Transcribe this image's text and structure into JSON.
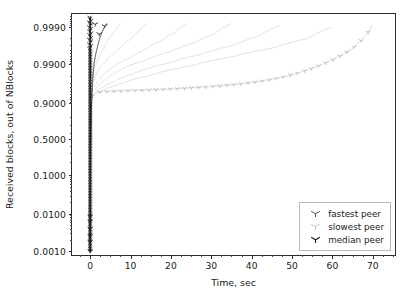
{
  "chart_data": {
    "type": "line",
    "title": "",
    "xlabel": "Time, sec",
    "ylabel": "Received blocks, out of NBlocks",
    "yscale": "logit",
    "xscale": "linear",
    "xlim": [
      -4.5,
      76.0
    ],
    "ylim": [
      0.0007,
      0.99955
    ],
    "grid": false,
    "xticks": [
      0,
      10,
      20,
      30,
      40,
      50,
      60,
      70
    ],
    "xtick_labels": [
      "0",
      "10",
      "20",
      "30",
      "40",
      "50",
      "60",
      "70"
    ],
    "yticks": [
      0.999,
      0.99,
      0.9,
      0.5,
      0.1,
      0.01,
      0.001
    ],
    "ytick_labels": [
      "0.9990",
      "0.9900",
      "0.9000",
      "0.5000",
      "0.1000",
      "0.0100",
      "0.0010"
    ],
    "legend_position": "lower right",
    "legend_entries": [
      "fastest peer",
      "slowest peer",
      "median peer"
    ],
    "colors": {
      "fastest_peer": "#3d3d3d",
      "slowest_peer": "#b9b9b9",
      "median_peer": "#1a1a1a",
      "other_peers": "#d6d6d6",
      "axis": "#2b2b2b",
      "background": "#ffffff"
    },
    "marker": "tri_down",
    "series": [
      {
        "name": "fastest peer",
        "color": "#3d3d3d",
        "x": [
          0.02,
          0.05,
          0.08,
          0.12,
          0.18,
          0.25,
          0.35,
          0.5,
          0.7,
          0.95,
          1.3,
          1.8,
          2.4,
          3.2,
          4.1
        ],
        "y": [
          0.001,
          0.01,
          0.1,
          0.3,
          0.5,
          0.7,
          0.9,
          0.95,
          0.98,
          0.99,
          0.994,
          0.9965,
          0.998,
          0.9988,
          0.9992
        ]
      },
      {
        "name": "slowest peer",
        "color": "#b9b9b9",
        "x": [
          0.4,
          1.2,
          2.0,
          3.0,
          4.0,
          5.5,
          7.0,
          9.0,
          11.0,
          13.0,
          15.0,
          17.0,
          19.0,
          21.0,
          23.0,
          25.0,
          27.0,
          29.0,
          31.0,
          33.0,
          35.0,
          37.0,
          39.0,
          41.0,
          43.0,
          45.0,
          47.0,
          49.0,
          51.0,
          53.0,
          55.0,
          57.0,
          59.0,
          61.0,
          63.0,
          65.0,
          67.0,
          68.5,
          70.0
        ],
        "y": [
          0.93,
          0.944,
          0.947,
          0.948,
          0.949,
          0.95,
          0.9505,
          0.9512,
          0.952,
          0.9528,
          0.9535,
          0.9545,
          0.9555,
          0.9565,
          0.9575,
          0.9588,
          0.96,
          0.9612,
          0.9625,
          0.964,
          0.9655,
          0.9672,
          0.969,
          0.971,
          0.973,
          0.9752,
          0.9775,
          0.98,
          0.9825,
          0.985,
          0.9872,
          0.9895,
          0.9915,
          0.9932,
          0.9948,
          0.9962,
          0.9976,
          0.9984,
          0.9991
        ]
      },
      {
        "name": "median peer",
        "color": "#1a1a1a",
        "x": [
          0.0,
          0.0,
          0.0,
          0.0,
          0.0,
          0.0,
          0.0,
          0.0,
          0.0,
          0.0,
          0.0,
          0.0
        ],
        "y": [
          0.001,
          0.0025,
          0.006,
          0.01,
          0.03,
          0.1,
          0.3,
          0.5,
          0.7,
          0.9,
          0.99,
          0.999
        ]
      },
      {
        "name": "other peer 1",
        "color": "#d6d6d6",
        "x": [
          0.6,
          1.5,
          2.5,
          3.5,
          4.5,
          5.5,
          6.5,
          7.5
        ],
        "y": [
          0.98,
          0.99,
          0.9945,
          0.9965,
          0.9978,
          0.9985,
          0.9989,
          0.9992
        ]
      },
      {
        "name": "other peer 2",
        "color": "#d6d6d6",
        "x": [
          0.8,
          2.0,
          4.0,
          6.0,
          8.0,
          10.0,
          12.0,
          14.0
        ],
        "y": [
          0.97,
          0.986,
          0.992,
          0.995,
          0.9968,
          0.9979,
          0.9987,
          0.9992
        ]
      },
      {
        "name": "other peer 3",
        "color": "#d6d6d6",
        "x": [
          1.0,
          3.0,
          6.0,
          10.0,
          14.0,
          18.0,
          21.0,
          24.0
        ],
        "y": [
          0.96,
          0.98,
          0.989,
          0.9935,
          0.9962,
          0.9978,
          0.9986,
          0.9992
        ]
      },
      {
        "name": "other peer 4",
        "color": "#d6d6d6",
        "x": [
          1.2,
          4.0,
          8.0,
          14.0,
          20.0,
          26.0,
          31.0,
          35.0
        ],
        "y": [
          0.955,
          0.976,
          0.987,
          0.9925,
          0.9955,
          0.9974,
          0.9985,
          0.9992
        ]
      },
      {
        "name": "other peer 5",
        "color": "#d6d6d6",
        "x": [
          1.5,
          6.0,
          12.0,
          20.0,
          28.0,
          36.0,
          42.0,
          47.0
        ],
        "y": [
          0.95,
          0.972,
          0.9845,
          0.9912,
          0.9948,
          0.997,
          0.9983,
          0.9991
        ]
      },
      {
        "name": "other peer 6",
        "color": "#d6d6d6",
        "x": [
          2.0,
          8.0,
          16.0,
          26.0,
          36.0,
          46.0,
          54.0,
          60.0
        ],
        "y": [
          0.947,
          0.969,
          0.982,
          0.9898,
          0.994,
          0.9965,
          0.998,
          0.999
        ]
      }
    ]
  }
}
